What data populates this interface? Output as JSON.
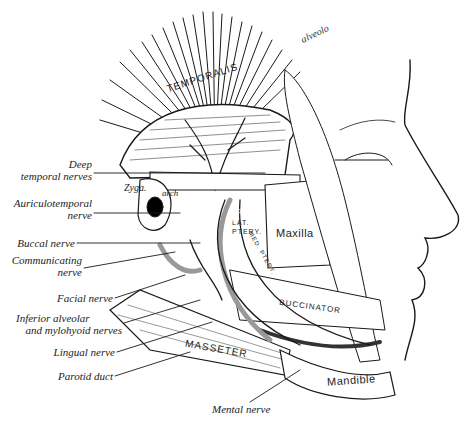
{
  "figure": {
    "background": "#ffffff",
    "ink": "#1a1a1a"
  },
  "callouts": [
    {
      "id": "deep-temporal",
      "line1": "Deep",
      "line2": "temporal nerves"
    },
    {
      "id": "auriculotemporal",
      "line1": "Auriculotemporal",
      "line2": "nerve"
    },
    {
      "id": "buccal",
      "line1": "Buccal nerve"
    },
    {
      "id": "communicating",
      "line1": "Communicating",
      "line2": "nerve"
    },
    {
      "id": "facial",
      "line1": "Facial nerve"
    },
    {
      "id": "inferior-alveolar",
      "line1": "Inferior alveolar",
      "line2": "and mylohyoid nerves"
    },
    {
      "id": "lingual",
      "line1": "Lingual nerve"
    },
    {
      "id": "parotid",
      "line1": "Parotid duct"
    },
    {
      "id": "mental",
      "line1": "Mental nerve"
    }
  ],
  "structure_labels": {
    "temporalis": "TEMPORALIS",
    "zyga": "Zyga.",
    "arch": "arch",
    "lat_ptery": "LAT. PTERY.",
    "maxilla": "Maxilla",
    "buccinator": "BUCCINATOR",
    "masseter": "MASSETER",
    "mandible": "Mandible",
    "maxillary": "Maxillary",
    "med_ptery": "MED. PTERY.",
    "handwritten": "alveolo"
  }
}
